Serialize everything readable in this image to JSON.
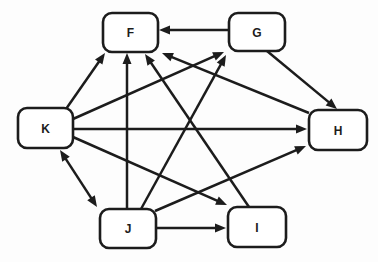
{
  "diagram": {
    "type": "directed-graph",
    "style": {
      "background": "#fdfdfd",
      "line_color": "#1c1c1c",
      "node_fill": "#ffffff",
      "node_border_width": 2.6,
      "line_width": 2.5,
      "corner_radius": 9,
      "arrow_length": 11,
      "arrow_width": 9,
      "label_font_size": 12
    },
    "nodes": [
      {
        "id": "F",
        "label": "F",
        "x": 103,
        "y": 13,
        "w": 55,
        "h": 39
      },
      {
        "id": "G",
        "label": "G",
        "x": 229,
        "y": 13,
        "w": 56,
        "h": 38
      },
      {
        "id": "K",
        "label": "K",
        "x": 18,
        "y": 108,
        "w": 55,
        "h": 40
      },
      {
        "id": "H",
        "label": "H",
        "x": 309,
        "y": 110,
        "w": 58,
        "h": 40
      },
      {
        "id": "J",
        "label": "J",
        "x": 100,
        "y": 209,
        "w": 56,
        "h": 39
      },
      {
        "id": "I",
        "label": "I",
        "x": 228,
        "y": 207,
        "w": 58,
        "h": 40
      }
    ],
    "edges": [
      {
        "from": "G",
        "to": "F",
        "bidirectional": false,
        "from_point": [
          229,
          30
        ],
        "to_point": [
          159,
          30
        ]
      },
      {
        "from": "K",
        "to": "F",
        "bidirectional": false,
        "from_point": [
          66,
          109
        ],
        "to_point": [
          105,
          53
        ]
      },
      {
        "from": "J",
        "to": "F",
        "bidirectional": false,
        "from_point": [
          127,
          209
        ],
        "to_point": [
          127,
          53
        ]
      },
      {
        "from": "I",
        "to": "F",
        "bidirectional": false,
        "from_point": [
          249,
          207
        ],
        "to_point": [
          145,
          54
        ]
      },
      {
        "from": "H",
        "to": "F",
        "bidirectional": false,
        "from_point": [
          309,
          113
        ],
        "to_point": [
          162,
          53
        ]
      },
      {
        "from": "K",
        "to": "G",
        "bidirectional": false,
        "from_point": [
          73,
          119
        ],
        "to_point": [
          224,
          52
        ]
      },
      {
        "from": "J",
        "to": "G",
        "bidirectional": false,
        "from_point": [
          141,
          209
        ],
        "to_point": [
          226,
          55
        ]
      },
      {
        "from": "G",
        "to": "H",
        "bidirectional": false,
        "from_point": [
          267,
          51
        ],
        "to_point": [
          337,
          109
        ]
      },
      {
        "from": "K",
        "to": "H",
        "bidirectional": false,
        "from_point": [
          73,
          129
        ],
        "to_point": [
          307,
          129
        ]
      },
      {
        "from": "J",
        "to": "H",
        "bidirectional": false,
        "from_point": [
          155,
          211
        ],
        "to_point": [
          306,
          146
        ]
      },
      {
        "from": "K",
        "to": "J",
        "bidirectional": true,
        "from_point": [
          60,
          150
        ],
        "to_point": [
          97,
          207
        ]
      },
      {
        "from": "J",
        "to": "I",
        "bidirectional": false,
        "from_point": [
          156,
          228
        ],
        "to_point": [
          226,
          228
        ]
      },
      {
        "from": "K",
        "to": "I",
        "bidirectional": false,
        "from_point": [
          73,
          137
        ],
        "to_point": [
          227,
          205
        ]
      }
    ]
  }
}
